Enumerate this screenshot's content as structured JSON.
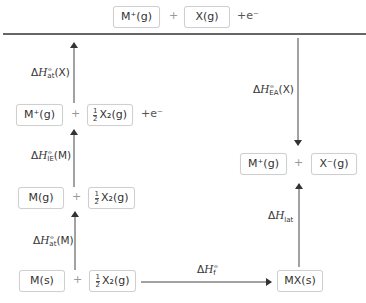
{
  "diagram": {
    "type": "Born-Haber cycle",
    "top_row": {
      "species1": "M⁺(g)",
      "plus": "+",
      "species2": "X(g)",
      "extra": "+e⁻"
    },
    "row2": {
      "species1": "M⁺(g)",
      "plus": "+",
      "species2_coeff": [
        "1",
        "2"
      ],
      "species2": "X₂(g)",
      "extra": "+e⁻"
    },
    "row3": {
      "species1": "M(g)",
      "plus": "+",
      "species2_coeff": [
        "1",
        "2"
      ],
      "species2": "X₂(g)"
    },
    "row4": {
      "species1": "M(s)",
      "plus": "+",
      "species2_coeff": [
        "1",
        "2"
      ],
      "species2": "X₂(g)"
    },
    "product": {
      "species": "MX(s)"
    },
    "right_row": {
      "species1": "M⁺(g)",
      "plus": "+",
      "species2": "X⁻(g)"
    },
    "labels": {
      "at_X": {
        "delta": "Δ",
        "H": "H",
        "sup": "⦵",
        "sub": "at",
        "arg": "(X)"
      },
      "ie_M": {
        "delta": "Δ",
        "H": "H",
        "sup": "⦵",
        "sub": "IE",
        "arg": "(M)"
      },
      "at_M": {
        "delta": "Δ",
        "H": "H",
        "sup": "⦵",
        "sub": "at",
        "arg": "(M)"
      },
      "ea_X": {
        "delta": "Δ",
        "H": "H",
        "sup": "⦵",
        "sub": "EA",
        "arg": "(X)"
      },
      "lat": {
        "delta": "Δ",
        "H": "H",
        "sub": "lat"
      },
      "f": {
        "delta": "Δ",
        "H": "H",
        "sup": "⦵",
        "sub": "f"
      }
    },
    "colors": {
      "line": "#333333",
      "box_border": "#cfcfcf",
      "plus": "#999999"
    }
  }
}
